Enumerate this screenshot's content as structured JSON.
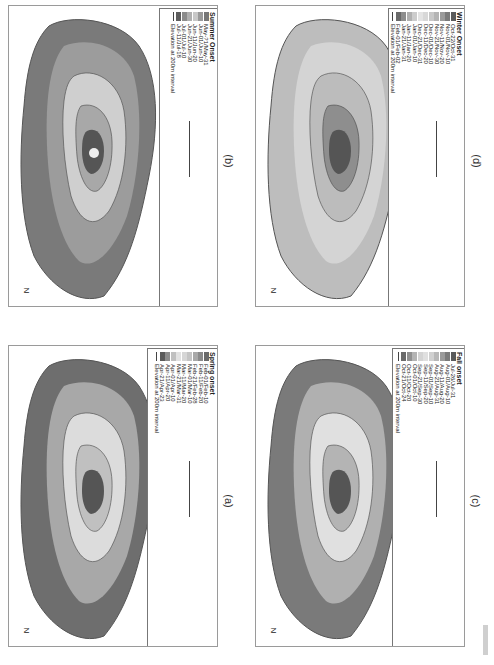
{
  "figure": {
    "orientation": "rotated 90 degrees clockwise",
    "panels": [
      {
        "id": "b",
        "caption": "(b)",
        "legend_title": "Summer Onset",
        "classes": [
          "May-?1/May-31",
          "Jun-01/Jun-10",
          "Jun-11/Jun-20",
          "Jun-21/Jun-30",
          "Jul-01/Jul-10",
          "Jul-11/Jul-18"
        ],
        "class_colors": [
          "#777777",
          "#9a9a9a",
          "#c8c8c8",
          "#b0b0b0",
          "#8c8c8c",
          "#5e5e5e"
        ],
        "elevation_label": "Elevation at 200m interval",
        "scale_labels": [
          "0",
          "10",
          "20 km"
        ],
        "north_label": "N"
      },
      {
        "id": "d",
        "caption": "(d)",
        "legend_title": "Winter Onset",
        "classes": [
          "Oct-22/Oct-31",
          "Nov-01/Nov-10",
          "Nov-11/Nov-20",
          "Nov-21/Nov-30",
          "Dec-01/Dec-10",
          "Dec-11/Dec-20",
          "Dec-21/Dec-31",
          "Jan-01/Jan-10",
          "Jan-11/Jan-20",
          "Jan-21/Jan-31",
          "Feb-01/Feb-02"
        ],
        "class_colors": [
          "#5a5a5a",
          "#7a7a7a",
          "#9a9a9a",
          "#b4b4b4",
          "#c8c8c8",
          "#d8d8d8",
          "#e4e4e4",
          "#cccccc",
          "#b0b0b0",
          "#8e8e8e",
          "#6a6a6a"
        ],
        "elevation_label": "Elevation at 200m interval",
        "scale_labels": [
          "0",
          "10",
          "20 km"
        ],
        "north_label": "N"
      },
      {
        "id": "a",
        "caption": "(a)",
        "legend_title": "Spring onset",
        "classes": [
          "Feb-01/Feb-10",
          "Feb-11/Feb-20",
          "Feb-21/Feb-28",
          "Mar-01/Mar-10",
          "Mar-11/Mar-20",
          "Mar-21/Mar-31",
          "Apr-01/Apr-10",
          "Apr-11/Apr-20",
          "Apr-21/Apr-23"
        ],
        "class_colors": [
          "#6a6a6a",
          "#8a8a8a",
          "#a8a8a8",
          "#c4c4c4",
          "#d6d6d6",
          "#e2e2e2",
          "#c0c0c0",
          "#8c8c8c",
          "#5a5a5a"
        ],
        "elevation_label": "Elevation at 200m interval",
        "scale_labels": [
          "0",
          "10",
          "20 km"
        ],
        "north_label": "N"
      },
      {
        "id": "c",
        "caption": "(c)",
        "legend_title": "Fall onset",
        "classes": [
          "Jul-26/Jul-31",
          "Aug-01/Aug-10",
          "Aug-11/Aug-20",
          "Aug-21/Aug-31",
          "Sep-01/Sep-10",
          "Sep-11/Sep-20",
          "Sep-21/Sep-30",
          "Oct-01/Oct-10",
          "Oct-11/Oct-20",
          "Oct-21/Oct-24"
        ],
        "class_colors": [
          "#5a5a5a",
          "#7a7a7a",
          "#9a9a9a",
          "#b8b8b8",
          "#d0d0d0",
          "#e0e0e0",
          "#d4d4d4",
          "#b4b4b4",
          "#909090",
          "#6a6a6a"
        ],
        "elevation_label": "Elevation at 200m interval",
        "scale_labels": [
          "0",
          "10",
          "20 km"
        ],
        "north_label": "N"
      }
    ],
    "contour_labels": [
      "200",
      "400",
      "600",
      "800",
      "1000",
      "1200",
      "1400",
      "1600",
      "1800"
    ]
  }
}
